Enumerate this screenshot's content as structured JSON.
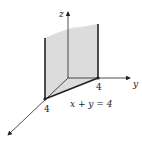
{
  "diagram": {
    "type": "3d-coordinate-plane-sketch",
    "axes": {
      "z_label": "z",
      "y_label": "y",
      "x_label": ""
    },
    "intercepts": {
      "x_intercept_label": "4",
      "y_intercept_label": "4"
    },
    "equation": "x + y = 4",
    "colors": {
      "plane_fill": "#dcdcdc",
      "line": "#222222",
      "background": "#ffffff"
    }
  }
}
